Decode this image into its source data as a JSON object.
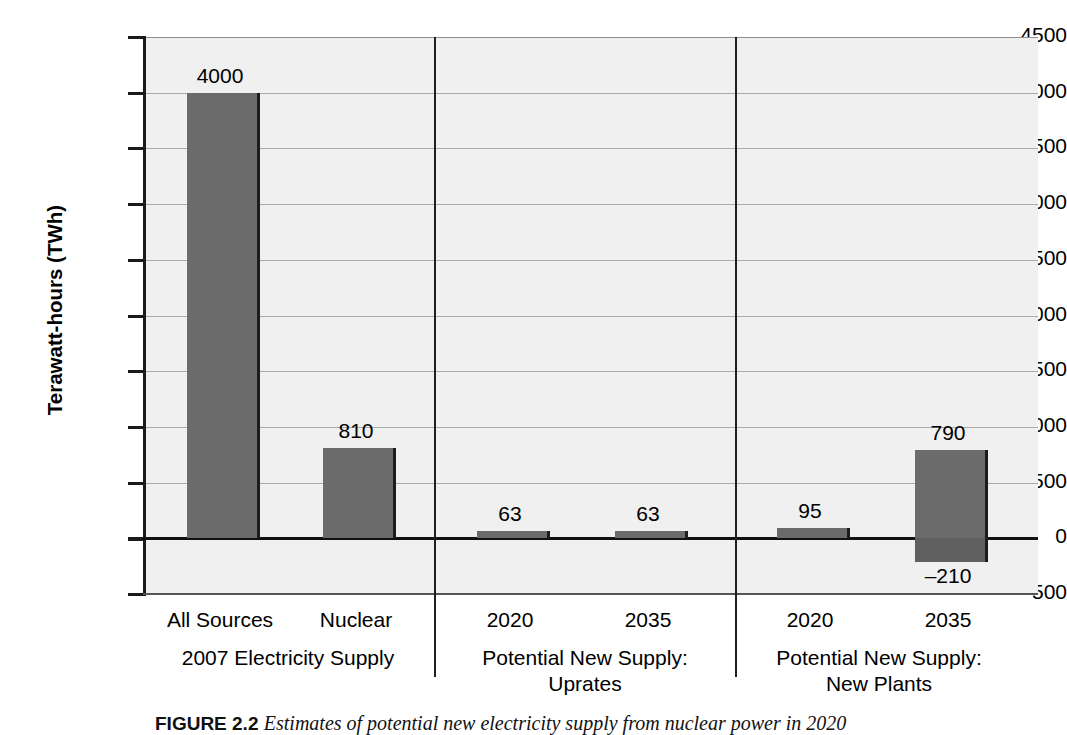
{
  "chart_data": {
    "type": "bar",
    "title": "",
    "xlabel": "",
    "ylabel": "Terawatt-hours (TWh)",
    "ylim": [
      -500,
      4500
    ],
    "ytick_step": 500,
    "grid": true,
    "legend": "none",
    "categories": [
      "All Sources",
      "Nuclear",
      "2020",
      "2035",
      "2020",
      "2035"
    ],
    "values": [
      4000,
      810,
      63,
      63,
      95,
      790
    ],
    "value_labels": [
      "4000",
      "810",
      "63",
      "63",
      "95",
      "790"
    ],
    "negative_values": [
      null,
      null,
      null,
      null,
      null,
      -210
    ],
    "negative_value_labels": [
      null,
      null,
      null,
      null,
      null,
      "–210"
    ],
    "groups": [
      {
        "label_line1": "2007 Electricity Supply",
        "label_line2": "",
        "categories": [
          "All Sources",
          "Nuclear"
        ]
      },
      {
        "label_line1": "Potential New Supply:",
        "label_line2": "Uprates",
        "categories": [
          "2020",
          "2035"
        ]
      },
      {
        "label_line1": "Potential New Supply:",
        "label_line2": "New Plants",
        "categories": [
          "2020",
          "2035"
        ]
      }
    ],
    "ytick_labels": [
      "4500",
      "4000",
      "3500",
      "3000",
      "2500",
      "2000",
      "1500",
      "1000",
      "500",
      "0",
      "–500"
    ],
    "ytick_values": [
      4500,
      4000,
      3500,
      3000,
      2500,
      2000,
      1500,
      1000,
      500,
      0,
      -500
    ],
    "colors": {
      "bar_fill": "#6b6b6b",
      "bar_edge": "#1d1d1d",
      "plot_background": "#eff0ef",
      "gridline": "#a9abaa",
      "axis": "#1a1a1a",
      "zero_line": "#111111"
    }
  },
  "axis": {
    "y_title": "Terawatt-hours (TWh)"
  },
  "bars": [
    {
      "id": "all-sources",
      "category": "All Sources",
      "value_label": "4000"
    },
    {
      "id": "nuclear",
      "category": "Nuclear",
      "value_label": "810"
    },
    {
      "id": "uprates-2020",
      "category": "2020",
      "value_label": "63"
    },
    {
      "id": "uprates-2035",
      "category": "2035",
      "value_label": "63"
    },
    {
      "id": "newplants-2020",
      "category": "2020",
      "value_label": "95"
    },
    {
      "id": "newplants-2035",
      "category": "2035",
      "value_label": "790",
      "negative_label": "–210"
    }
  ],
  "groups": [
    {
      "line1": "2007 Electricity Supply",
      "line2": ""
    },
    {
      "line1": "Potential New Supply:",
      "line2": "Uprates"
    },
    {
      "line1": "Potential New Supply:",
      "line2": "New Plants"
    }
  ],
  "caption": {
    "figure_number": "FIGURE 2.2",
    "text": "Estimates of potential new electricity supply from nuclear power in 2020"
  },
  "ticks": {
    "labels": [
      "4500",
      "4000",
      "3500",
      "3000",
      "2500",
      "2000",
      "1500",
      "1000",
      "500",
      "0",
      "–500"
    ]
  }
}
